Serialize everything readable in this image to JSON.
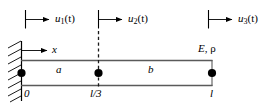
{
  "figure": {
    "type": "structural-beam-element-diagram",
    "colors": {
      "line": "#3f3f3f",
      "ink": "#000000",
      "node": "#000000",
      "background": "#ffffff"
    },
    "dof_arrows": [
      {
        "name": "u1",
        "label_base": "u",
        "label_sub": "1",
        "label_arg": "(t)",
        "x": 25
      },
      {
        "name": "u2",
        "label_base": "u",
        "label_sub": "2",
        "label_arg": "(t)",
        "x": 98
      },
      {
        "name": "u3",
        "label_base": "u",
        "label_sub": "3",
        "label_arg": "(t)",
        "x": 208
      }
    ],
    "axis": {
      "label": "x"
    },
    "material": {
      "modulus": "E",
      "comma": ", ",
      "density": "ρ"
    },
    "elements": [
      {
        "name": "element-a",
        "label": "a"
      },
      {
        "name": "element-b",
        "label": "b"
      }
    ],
    "coordinates": [
      {
        "name": "origin",
        "label": "0",
        "x": 21
      },
      {
        "name": "third",
        "label": "l/3",
        "x": 98
      },
      {
        "name": "length",
        "label": "l",
        "x": 212
      }
    ],
    "nodes": [
      {
        "name": "node-1",
        "x": 21,
        "y": 73
      },
      {
        "name": "node-2",
        "x": 98,
        "y": 73
      },
      {
        "name": "node-3",
        "x": 212,
        "y": 73
      }
    ],
    "beam": {
      "left": 21,
      "right": 212,
      "top": 60,
      "bottom": 86
    },
    "support": {
      "name": "fixed-wall-hatching",
      "x": 21,
      "top": 41,
      "bottom": 101
    }
  }
}
